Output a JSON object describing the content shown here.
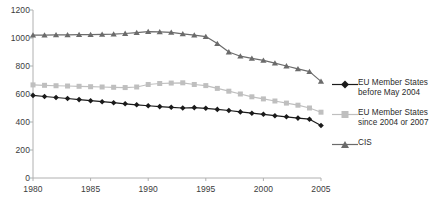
{
  "chart_data": {
    "type": "line",
    "title": "",
    "xlabel": "",
    "ylabel": "",
    "xlim": [
      1980,
      2005
    ],
    "ylim": [
      0,
      1200
    ],
    "ytick_step": 200,
    "xtick_step": 5,
    "grid": false,
    "legend_position": "right",
    "x": [
      1980,
      1981,
      1982,
      1983,
      1984,
      1985,
      1986,
      1987,
      1988,
      1989,
      1990,
      1991,
      1992,
      1993,
      1994,
      1995,
      1996,
      1997,
      1998,
      1999,
      2000,
      2001,
      2002,
      2003,
      2004,
      2005
    ],
    "ytick_labels": [
      "0",
      "200",
      "400",
      "600",
      "800",
      "1000",
      "1200"
    ],
    "xtick_labels": [
      "1980",
      "1985",
      "1990",
      "1995",
      "2000",
      "2005"
    ],
    "series": [
      {
        "name": "EU Member States before May 2004",
        "key": "eu_before_2004",
        "color": "#1a1a1a",
        "marker": "diamond",
        "values": [
          590,
          582,
          575,
          568,
          560,
          552,
          545,
          538,
          530,
          523,
          516,
          510,
          505,
          500,
          503,
          498,
          490,
          482,
          472,
          463,
          455,
          445,
          437,
          428,
          420,
          375
        ]
      },
      {
        "name": "EU Member States since 2004 or 2007",
        "key": "eu_since_2004_2007",
        "color": "#bfbfbf",
        "marker": "square",
        "values": [
          665,
          662,
          659,
          657,
          655,
          652,
          650,
          648,
          646,
          650,
          668,
          675,
          678,
          680,
          668,
          660,
          640,
          620,
          600,
          580,
          565,
          550,
          535,
          520,
          500,
          470
        ]
      },
      {
        "name": "CIS",
        "key": "cis",
        "color": "#6b6b6b",
        "marker": "triangle",
        "values": [
          1020,
          1020,
          1022,
          1022,
          1024,
          1024,
          1026,
          1028,
          1032,
          1038,
          1045,
          1044,
          1040,
          1030,
          1020,
          1010,
          960,
          900,
          870,
          855,
          840,
          820,
          800,
          780,
          760,
          690
        ]
      }
    ]
  },
  "legend": {
    "items": [
      {
        "label": "EU Member States\nbefore May 2004",
        "color": "#1a1a1a",
        "marker": "diamond"
      },
      {
        "label": "EU Member States\nsince 2004 or 2007",
        "color": "#bfbfbf",
        "marker": "square"
      },
      {
        "label": "CIS",
        "color": "#6b6b6b",
        "marker": "triangle"
      }
    ]
  },
  "axes": {
    "axis_color": "#b0b0b0",
    "tick_text_color": "#3b3b3b"
  }
}
